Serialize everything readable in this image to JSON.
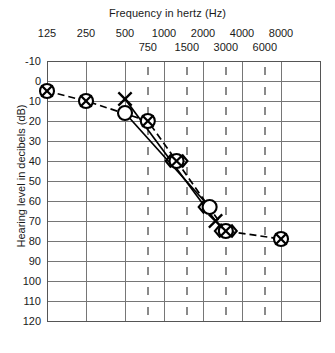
{
  "chart_data": {
    "type": "line",
    "title": "Frequency in hertz (Hz)",
    "xlabel": "Frequency in hertz (Hz)",
    "ylabel": "Hearing level in decibels (dB)",
    "xscale": "log-octave",
    "ylim": [
      -10,
      120
    ],
    "yticks": [
      -10,
      0,
      10,
      20,
      30,
      40,
      50,
      60,
      70,
      80,
      90,
      100,
      110,
      120
    ],
    "xticks_octave": [
      125,
      250,
      500,
      1000,
      2000,
      4000,
      8000
    ],
    "xticks_half_octave": [
      750,
      1500,
      3000,
      6000
    ],
    "grid": true,
    "legend": "none",
    "series": [
      {
        "name": "Masked air conduction",
        "symbol": "circle-with-x",
        "linestyle": "dashed",
        "points": [
          {
            "freq": 125,
            "db": 5
          },
          {
            "freq": 250,
            "db": 10
          },
          {
            "freq": 750,
            "db": 20
          },
          {
            "freq": 1250,
            "db": 40
          },
          {
            "freq": 3000,
            "db": 75
          },
          {
            "freq": 8000,
            "db": 79
          }
        ]
      },
      {
        "name": "Unmasked left air conduction",
        "symbol": "x",
        "linestyle": "solid",
        "points": [
          {
            "freq": 500,
            "db": 9
          },
          {
            "freq": 2500,
            "db": 70
          }
        ]
      },
      {
        "name": "Unmasked right air conduction",
        "symbol": "circle",
        "linestyle": "solid",
        "points": [
          {
            "freq": 500,
            "db": 16
          },
          {
            "freq": 2250,
            "db": 63
          }
        ]
      }
    ],
    "bone_conduction_markers": [
      {
        "freq": 1250,
        "db": 40,
        "side": "both"
      },
      {
        "freq": 2250,
        "db": 63,
        "side": "left"
      },
      {
        "freq": 3000,
        "db": 75,
        "side": "both"
      }
    ]
  },
  "axes": {
    "title": "Frequency in hertz (Hz)",
    "y_axis_title": "Hearing level in decibels (dB)",
    "x_octave": [
      "125",
      "250",
      "500",
      "1000",
      "2000",
      "4000",
      "8000"
    ],
    "x_half": [
      "750",
      "1500",
      "3000",
      "6000"
    ],
    "y_ticks": [
      "-10",
      "0",
      "10",
      "20",
      "30",
      "40",
      "50",
      "60",
      "70",
      "80",
      "90",
      "100",
      "110",
      "120"
    ]
  },
  "style": {
    "grid_color": "#767676",
    "axis_color": "#555555",
    "plot_color": "#000000"
  }
}
